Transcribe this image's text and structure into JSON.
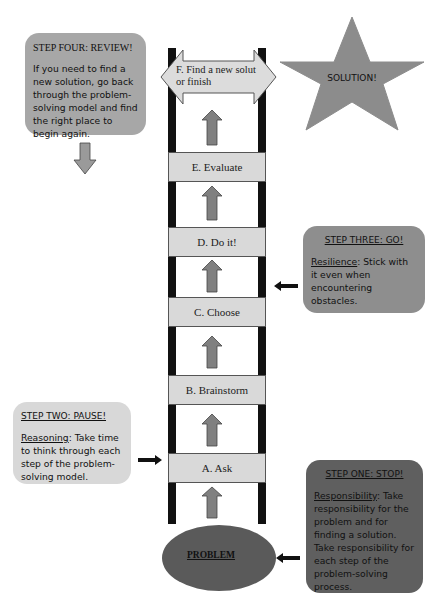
{
  "diagram": {
    "ladder": {
      "top_step": {
        "label": "F. Find a new solut or finish"
      },
      "rungs": [
        {
          "id": "E",
          "label": "E. Evaluate"
        },
        {
          "id": "D",
          "label": "D. Do it!"
        },
        {
          "id": "C",
          "label": "C. Choose"
        },
        {
          "id": "B",
          "label": "B. Brainstorm"
        },
        {
          "id": "A",
          "label": "A. Ask"
        }
      ],
      "base": {
        "label": "PROBLEM"
      }
    },
    "goal": {
      "label": "SOLUTION!",
      "shape": "star"
    },
    "steps": [
      {
        "id": "step-four",
        "title": "STEP FOUR: REVIEW!",
        "keyword": "",
        "text": "If you need to find a new solution, go back through the problem-solving model and find the right place to begin again.",
        "points_to": "down"
      },
      {
        "id": "step-three",
        "title": "STEP THREE: GO!",
        "keyword": "Resilience",
        "text": ": Stick with it even when encountering obstacles.",
        "points_to": "C. Choose / D. Do it!"
      },
      {
        "id": "step-two",
        "title": "STEP TWO: PAUSE!",
        "keyword": "Reasoning",
        "text": ": Take time to think through each step of the problem-solving model.",
        "points_to": "A. Ask"
      },
      {
        "id": "step-one",
        "title": "STEP ONE: STOP!",
        "keyword": "Responsibility",
        "text": ": Take responsibility for the problem and for finding a solution. Take responsibility for each step of the problem-solving process.",
        "points_to": "PROBLEM"
      }
    ],
    "colors": {
      "rail": "#111111",
      "rung": "#d9d9d9",
      "up_arrow": "#808080",
      "problem_ellipse": "#5a5a5a",
      "star": "#8c8c8c",
      "step_one_box": "#5f5f5f",
      "step_two_box": "#d8d8d8",
      "step_three_box": "#8e8e8e",
      "step_four_box": "#a7a7a7"
    }
  }
}
